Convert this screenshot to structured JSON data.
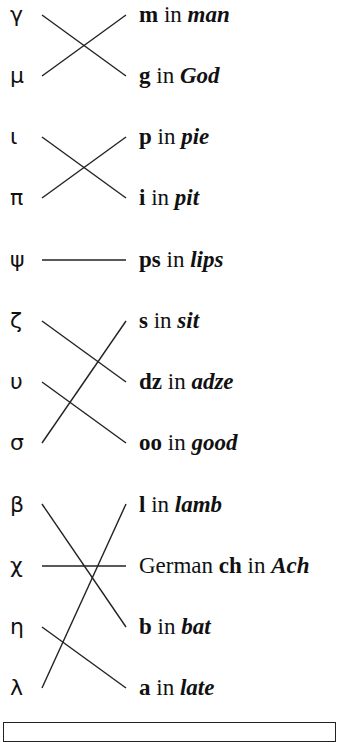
{
  "diagram": {
    "type": "matching-lines",
    "line_color": "#222222",
    "greek_letters": [
      {
        "symbol": "γ",
        "name": "gamma"
      },
      {
        "symbol": "μ",
        "name": "mu"
      },
      {
        "symbol": "ι",
        "name": "iota"
      },
      {
        "symbol": "π",
        "name": "pi"
      },
      {
        "symbol": "ψ",
        "name": "psi"
      },
      {
        "symbol": "ζ",
        "name": "zeta"
      },
      {
        "symbol": "υ",
        "name": "upsilon"
      },
      {
        "symbol": "σ",
        "name": "sigma"
      },
      {
        "symbol": "β",
        "name": "beta"
      },
      {
        "symbol": "χ",
        "name": "chi"
      },
      {
        "symbol": "η",
        "name": "eta"
      },
      {
        "symbol": "λ",
        "name": "lambda"
      }
    ],
    "sounds": [
      {
        "prefix": "",
        "sound": "m",
        "in": " in ",
        "word": "man"
      },
      {
        "prefix": "",
        "sound": "g",
        "in": " in ",
        "word": "God"
      },
      {
        "prefix": "",
        "sound": "p",
        "in": " in ",
        "word": "pie"
      },
      {
        "prefix": "",
        "sound": "i",
        "in": " in ",
        "word": "pit"
      },
      {
        "prefix": "",
        "sound": "ps",
        "in": " in ",
        "word": "lips"
      },
      {
        "prefix": "",
        "sound": "s",
        "in": " in ",
        "word": "sit"
      },
      {
        "prefix": "",
        "sound": "dz",
        "in": " in ",
        "word": "adze"
      },
      {
        "prefix": "",
        "sound": "oo",
        "in": " in ",
        "word": "good"
      },
      {
        "prefix": "",
        "sound": "l",
        "in": " in ",
        "word": "lamb"
      },
      {
        "prefix": "German ",
        "sound": "ch",
        "in": " in ",
        "word": "Ach"
      },
      {
        "prefix": "",
        "sound": "b",
        "in": " in ",
        "word": "bat"
      },
      {
        "prefix": "",
        "sound": "a",
        "in": " in ",
        "word": "late"
      }
    ],
    "matches": [
      {
        "greek": "γ",
        "sound": "g in God"
      },
      {
        "greek": "μ",
        "sound": "m in man"
      },
      {
        "greek": "ι",
        "sound": "i in pit"
      },
      {
        "greek": "π",
        "sound": "p in pie"
      },
      {
        "greek": "ψ",
        "sound": "ps in lips"
      },
      {
        "greek": "ζ",
        "sound": "dz in adze"
      },
      {
        "greek": "υ",
        "sound": "oo in good"
      },
      {
        "greek": "σ",
        "sound": "s in sit"
      },
      {
        "greek": "β",
        "sound": "b in bat"
      },
      {
        "greek": "χ",
        "sound": "German ch in Ach"
      },
      {
        "greek": "η",
        "sound": "a in late"
      },
      {
        "greek": "λ",
        "sound": "l in lamb"
      }
    ]
  }
}
